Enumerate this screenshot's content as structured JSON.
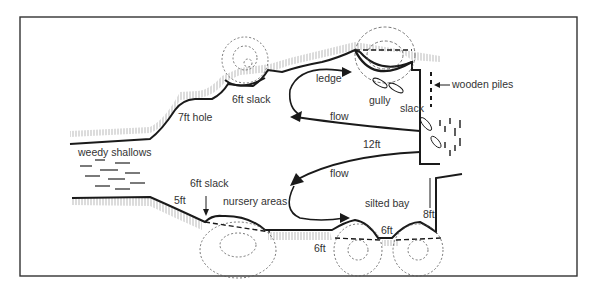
{
  "diagram": {
    "type": "river-swim-plan",
    "labels": {
      "ledge": "ledge",
      "gully": "gully",
      "slack_top_right": "slack",
      "wooden_piles": "wooden piles",
      "slack_6ft_top": "6ft slack",
      "hole_7ft": "7ft hole",
      "flow_top": "flow",
      "depth_12ft": "12ft",
      "weedy_shallows": "weedy shallows",
      "flow_bottom": "flow",
      "slack_6ft_bottom": "6ft slack",
      "depth_5ft": "5ft",
      "nursery_areas": "nursery areas",
      "silted_bay": "silted bay",
      "depth_8ft": "8ft",
      "depth_6ft_a": "6ft",
      "depth_6ft_b": "6ft"
    },
    "colors": {
      "ink": "#1a1a1a",
      "frame": "#333333",
      "background": "#ffffff"
    }
  }
}
